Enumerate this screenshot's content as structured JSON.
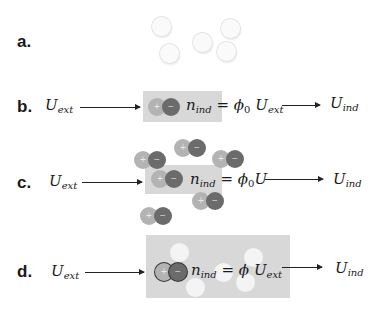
{
  "rows": [
    {
      "id": "a",
      "label": "a.",
      "neutral_particles": 5
    },
    {
      "id": "b",
      "label": "b.",
      "input": {
        "symbol": "U",
        "sub": "ext"
      },
      "equation": {
        "lhs": "n",
        "lhs_sub": "ind",
        "eq": "=",
        "coef": "ϕ",
        "coef_sub": "0",
        "rhs": "U",
        "rhs_sub": "ext"
      },
      "output": {
        "symbol": "U",
        "sub": "ind"
      }
    },
    {
      "id": "c",
      "label": "c.",
      "input": {
        "symbol": "U",
        "sub": "ext"
      },
      "equation": {
        "lhs": "n",
        "lhs_sub": "ind",
        "eq": "=",
        "coef": "ϕ",
        "coef_sub": "0",
        "rhs": "U"
      },
      "output": {
        "symbol": "U",
        "sub": "ind"
      }
    },
    {
      "id": "d",
      "label": "d.",
      "input": {
        "symbol": "U",
        "sub": "ext"
      },
      "equation": {
        "lhs": "n",
        "lhs_sub": "ind",
        "eq": "=",
        "coef": "ϕ",
        "rhs": "U",
        "rhs_sub": "ext"
      },
      "output": {
        "symbol": "U",
        "sub": "ind"
      }
    }
  ],
  "dipole": {
    "plus": "+",
    "minus": "−"
  },
  "colors": {
    "box": "#d8d8d8",
    "positive": "#b3b3b3",
    "negative": "#6b6b6b",
    "neutral": "#fafafa"
  }
}
